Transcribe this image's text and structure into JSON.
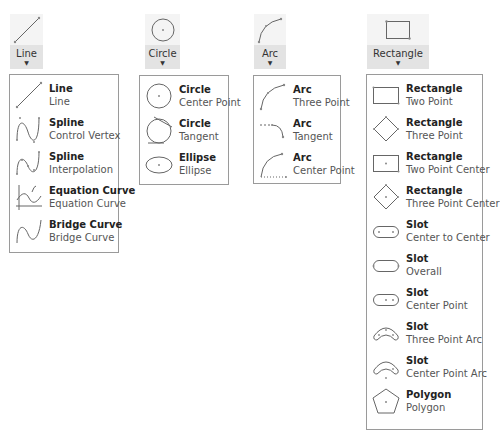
{
  "buttons": [
    {
      "id": "line",
      "label": "Line"
    },
    {
      "id": "circle",
      "label": "Circle"
    },
    {
      "id": "arc",
      "label": "Arc"
    },
    {
      "id": "rectangle",
      "label": "Rectangle"
    }
  ],
  "menus": {
    "line": [
      {
        "title": "Line",
        "subtitle": "Line",
        "icon": "line-icon"
      },
      {
        "title": "Spline",
        "subtitle": "Control Vertex",
        "icon": "spline-control-vertex-icon"
      },
      {
        "title": "Spline",
        "subtitle": "Interpolation",
        "icon": "spline-interpolation-icon"
      },
      {
        "title": "Equation Curve",
        "subtitle": "Equation Curve",
        "icon": "equation-curve-icon"
      },
      {
        "title": "Bridge Curve",
        "subtitle": "Bridge Curve",
        "icon": "bridge-curve-icon"
      }
    ],
    "circle": [
      {
        "title": "Circle",
        "subtitle": "Center Point",
        "icon": "circle-center-point-icon"
      },
      {
        "title": "Circle",
        "subtitle": "Tangent",
        "icon": "circle-tangent-icon"
      },
      {
        "title": "Ellipse",
        "subtitle": "Ellipse",
        "icon": "ellipse-icon"
      }
    ],
    "arc": [
      {
        "title": "Arc",
        "subtitle": "Three Point",
        "icon": "arc-three-point-icon"
      },
      {
        "title": "Arc",
        "subtitle": "Tangent",
        "icon": "arc-tangent-icon"
      },
      {
        "title": "Arc",
        "subtitle": "Center Point",
        "icon": "arc-center-point-icon"
      }
    ],
    "rectangle": [
      {
        "title": "Rectangle",
        "subtitle": "Two Point",
        "icon": "rectangle-two-point-icon"
      },
      {
        "title": "Rectangle",
        "subtitle": "Three Point",
        "icon": "rectangle-three-point-icon"
      },
      {
        "title": "Rectangle",
        "subtitle": "Two Point Center",
        "icon": "rectangle-two-point-center-icon"
      },
      {
        "title": "Rectangle",
        "subtitle": "Three Point Center",
        "icon": "rectangle-three-point-center-icon"
      },
      {
        "title": "Slot",
        "subtitle": "Center to Center",
        "icon": "slot-center-to-center-icon"
      },
      {
        "title": "Slot",
        "subtitle": "Overall",
        "icon": "slot-overall-icon"
      },
      {
        "title": "Slot",
        "subtitle": "Center Point",
        "icon": "slot-center-point-icon"
      },
      {
        "title": "Slot",
        "subtitle": "Three Point Arc",
        "icon": "slot-three-point-arc-icon"
      },
      {
        "title": "Slot",
        "subtitle": "Center Point Arc",
        "icon": "slot-center-point-arc-icon"
      },
      {
        "title": "Polygon",
        "subtitle": "Polygon",
        "icon": "polygon-icon"
      }
    ]
  },
  "colors": {
    "button_icon_bg": "#f4f4f4",
    "button_label_bg": "#e3e3e3",
    "panel_border": "#9a9a9a"
  }
}
